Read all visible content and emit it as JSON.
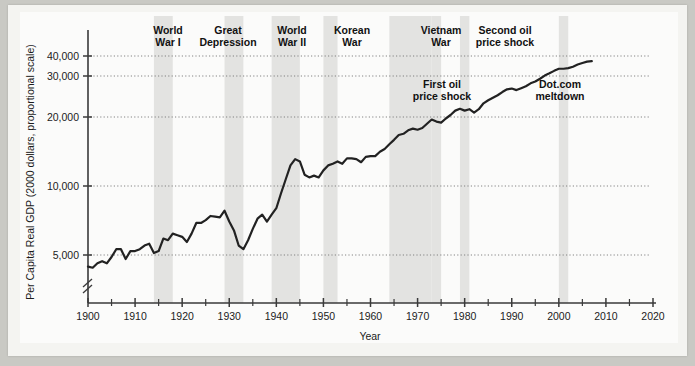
{
  "chart_data": {
    "type": "line",
    "title": "",
    "xlabel": "Year",
    "ylabel": "Per Capita Real GDP (2000 dollars, proportional scale)",
    "scale": "log",
    "grid": true,
    "legend": "none",
    "xlim": [
      1900,
      2020
    ],
    "ylim": [
      4000,
      45000
    ],
    "xticks": [
      1900,
      1910,
      1920,
      1930,
      1940,
      1950,
      1960,
      1970,
      1980,
      1990,
      2000,
      2010,
      2020
    ],
    "xtick_labels": [
      "1900",
      "1910",
      "1920",
      "1930",
      "1940",
      "1950",
      "1960",
      "1970",
      "1980",
      "1990",
      "2000",
      "2010",
      "2020"
    ],
    "xminor_ticks": [
      1905,
      1915,
      1925,
      1935,
      1945,
      1955,
      1965,
      1975,
      1985,
      1995,
      2005,
      2015
    ],
    "yticks": [
      5000,
      10000,
      20000,
      30000,
      40000
    ],
    "ytick_labels": [
      "5,000",
      "10,000",
      "20,000",
      "30,000",
      "40,000"
    ],
    "axis_break": true,
    "series_name": "Per Capita Real GDP",
    "x": [
      1900,
      1901,
      1902,
      1903,
      1904,
      1905,
      1906,
      1907,
      1908,
      1909,
      1910,
      1911,
      1912,
      1913,
      1914,
      1915,
      1916,
      1917,
      1918,
      1919,
      1920,
      1921,
      1922,
      1923,
      1924,
      1925,
      1926,
      1927,
      1928,
      1929,
      1930,
      1931,
      1932,
      1933,
      1934,
      1935,
      1936,
      1937,
      1938,
      1939,
      1940,
      1941,
      1942,
      1943,
      1944,
      1945,
      1946,
      1947,
      1948,
      1949,
      1950,
      1951,
      1952,
      1953,
      1954,
      1955,
      1956,
      1957,
      1958,
      1959,
      1960,
      1961,
      1962,
      1963,
      1964,
      1965,
      1966,
      1967,
      1968,
      1969,
      1970,
      1971,
      1972,
      1973,
      1974,
      1975,
      1976,
      1977,
      1978,
      1979,
      1980,
      1981,
      1982,
      1983,
      1984,
      1985,
      1986,
      1987,
      1988,
      1989,
      1990,
      1991,
      1992,
      1993,
      1994,
      1995,
      1996,
      1997,
      1998,
      1999,
      2000,
      2001,
      2002,
      2003,
      2004,
      2005,
      2006,
      2007
    ],
    "values": [
      4450,
      4400,
      4600,
      4700,
      4600,
      4900,
      5300,
      5300,
      4800,
      5200,
      5200,
      5300,
      5500,
      5600,
      5100,
      5200,
      5900,
      5800,
      6200,
      6100,
      6000,
      5700,
      6200,
      6900,
      6900,
      7100,
      7400,
      7350,
      7300,
      7800,
      7000,
      6400,
      5500,
      5300,
      5800,
      6500,
      7200,
      7500,
      7000,
      7500,
      8000,
      9300,
      10700,
      12300,
      13100,
      12800,
      11200,
      10900,
      11100,
      10900,
      11700,
      12300,
      12500,
      12800,
      12500,
      13200,
      13200,
      13100,
      12700,
      13400,
      13500,
      13500,
      14100,
      14500,
      15200,
      15900,
      16700,
      16900,
      17500,
      17800,
      17600,
      17900,
      18700,
      19500,
      19100,
      18900,
      19700,
      20400,
      21300,
      21700,
      21300,
      21600,
      20900,
      21600,
      22900,
      23600,
      24200,
      24800,
      25600,
      26300,
      26500,
      26100,
      26600,
      27100,
      27900,
      28400,
      29200,
      30200,
      31200,
      32300,
      33300,
      33300,
      33600,
      34300,
      35400,
      36200,
      36900,
      37200
    ]
  },
  "shaded_bands": [
    {
      "name": "World War I",
      "label": "World\nWar I",
      "label_line1": "World",
      "label_line2": "War I",
      "start": 1914,
      "end": 1918
    },
    {
      "name": "Great Depression",
      "label_line1": "Great",
      "label_line2": "Depression",
      "start": 1929,
      "end": 1933
    },
    {
      "name": "World War II",
      "label_line1": "World",
      "label_line2": "War II",
      "start": 1939,
      "end": 1945
    },
    {
      "name": "Korean War",
      "label_line1": "Korean",
      "label_line2": "War",
      "start": 1950,
      "end": 1953
    },
    {
      "name": "Vietnam War",
      "label_line1": "Vietnam",
      "label_line2": "War",
      "start": 1964,
      "end": 1973
    },
    {
      "name": "First oil price shock",
      "label_line1": "First oil",
      "label_line2": "price shock",
      "start": 1973,
      "end": 1975
    },
    {
      "name": "Second oil price shock",
      "label_line1": "Second oil",
      "label_line2": "price shock",
      "start": 1979,
      "end": 1981
    },
    {
      "name": "Dot.com meltdown",
      "label_line1": "Dot.com",
      "label_line2": "meltdown",
      "start": 2000,
      "end": 2002
    }
  ],
  "colors": {
    "page": "#f4f4f1",
    "plot_bg": "#fbfbfa",
    "line": "#222222",
    "band": "#e3e3e1",
    "axis": "#3a3a3a",
    "grid": "#777777",
    "text": "#111111"
  }
}
